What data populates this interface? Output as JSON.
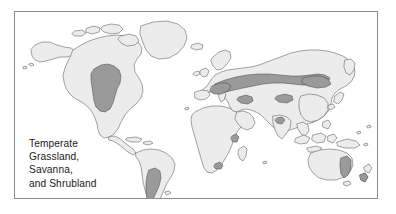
{
  "figure": {
    "type": "world-biome-distribution-map",
    "width": 396,
    "height": 214,
    "background_color": "#ffffff"
  },
  "frame": {
    "border_color": "#8c8c8c",
    "border_width_px": 1,
    "fill_color": "#ffffff"
  },
  "caption": {
    "lines": [
      "Temperate",
      "Grassland,",
      "Savanna,",
      "and Shrubland"
    ],
    "full_text": "Temperate Grassland, Savanna, and Shrubland",
    "text_color": "#1a1a1a",
    "font_size_px": 10.2,
    "position": "lower-left"
  },
  "legend": {
    "highlight_meaning": "Temperate Grassland, Savanna, and Shrubland biome extent",
    "highlight_color": "#9a9a9a",
    "land_color": "#ececec",
    "ocean_color": "#ffffff",
    "coastline_color": "#595959"
  },
  "map": {
    "projection": "robinson-like world projection",
    "ocean_fill": "#ffffff",
    "land_fill": "#ececec",
    "land_stroke": "#595959",
    "land_stroke_width": 0.55,
    "highlight_fill": "#9a9a9a",
    "highlight_stroke": "#4d4d4d",
    "highlight_stroke_width": 0.55
  },
  "highlighted_regions": [
    {
      "name": "north-american-great-plains",
      "continent": "North America"
    },
    {
      "name": "eurasian-steppe-belt",
      "continent": "Eurasia"
    },
    {
      "name": "south-american-pampas-patagonia",
      "continent": "South America"
    },
    {
      "name": "southeastern-australia-grassland",
      "continent": "Australia"
    },
    {
      "name": "new-zealand-grassland",
      "continent": "Oceania"
    },
    {
      "name": "east-african-highland-patch",
      "continent": "Africa"
    },
    {
      "name": "southern-africa-patch",
      "continent": "Africa"
    },
    {
      "name": "northern-india-patch",
      "continent": "Asia"
    }
  ],
  "landmasses": [
    {
      "name": "north-america"
    },
    {
      "name": "greenland"
    },
    {
      "name": "south-america"
    },
    {
      "name": "africa"
    },
    {
      "name": "eurasia"
    },
    {
      "name": "australia"
    },
    {
      "name": "new-zealand"
    },
    {
      "name": "japan"
    },
    {
      "name": "indonesia-archipelago"
    },
    {
      "name": "madagascar"
    },
    {
      "name": "british-isles"
    },
    {
      "name": "iceland"
    },
    {
      "name": "arctic-islands"
    }
  ]
}
